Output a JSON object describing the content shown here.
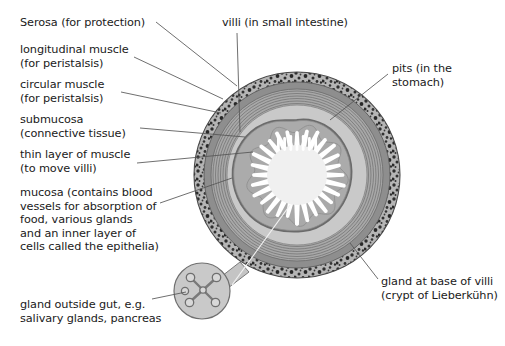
{
  "figure": {
    "background_color": "#ffffff",
    "text_color": "#1a1a1a",
    "leader_line_color": "#555555"
  },
  "palette": {
    "serosa_speckle_base": "#b9b9b9",
    "serosa_speckle_dot": "#2b2b2b",
    "longitudinal_muscle": "#8e8e8e",
    "circular_muscle": "#a6a6a6",
    "circular_muscle_stripe": "#7d7d7d",
    "submucosa": "#c9c9c9",
    "thin_muscle_layer": "#6f6f6f",
    "mucosa": "#a9a9a9",
    "villi": "#ffffff",
    "lumen": "#efefef",
    "gland_fill": "#c9c9c9",
    "gland_outline": "#6f6f6f"
  },
  "labels": {
    "serosa": {
      "lines": [
        "Serosa (for protection)"
      ],
      "x": 20,
      "y": 16
    },
    "longitudinal_muscle": {
      "lines": [
        "longitudinal muscle",
        "(for peristalsis)"
      ],
      "x": 20,
      "y": 43
    },
    "circular_muscle": {
      "lines": [
        "circular muscle",
        "(for peristalsis)"
      ],
      "x": 20,
      "y": 78
    },
    "submucosa": {
      "lines": [
        "submucosa",
        "(connective tissue)"
      ],
      "x": 20,
      "y": 113
    },
    "thin_layer_of_muscle": {
      "lines": [
        "thin layer of muscle",
        "(to move villi)"
      ],
      "x": 20,
      "y": 148
    },
    "mucosa": {
      "lines": [
        "mucosa (contains blood",
        "vessels for absorption of",
        "food, various glands",
        "and an inner layer of",
        "cells called the epithelia)"
      ],
      "x": 20,
      "y": 186
    },
    "gland_outside_gut": {
      "lines": [
        "gland outside gut, e.g.",
        "salivary glands, pancreas"
      ],
      "x": 20,
      "y": 298
    },
    "villi": {
      "lines": [
        "villi (in small intestine)"
      ],
      "x": 222,
      "y": 16
    },
    "pits": {
      "lines": [
        "pits (in the",
        "stomach)"
      ],
      "x": 392,
      "y": 62
    },
    "gland_at_base_of_villi": {
      "lines": [
        "gland at base of villi",
        "(crypt of Lieberkühn)"
      ],
      "x": 381,
      "y": 275
    }
  },
  "structure": {
    "center_x": 297,
    "center_y": 175,
    "outer_radius": 103,
    "layers": [
      {
        "name": "serosa",
        "outer_r": 103,
        "inner_r": 93
      },
      {
        "name": "longitudinal-muscle",
        "outer_r": 93,
        "inner_r": 86
      },
      {
        "name": "circular-muscle",
        "outer_r": 86,
        "inner_r": 71
      },
      {
        "name": "submucosa",
        "outer_r": 71,
        "inner_r": 52
      },
      {
        "name": "thin-layer-of-muscle",
        "outer_r": 52,
        "inner_r": 48
      },
      {
        "name": "mucosa",
        "outer_r": 48,
        "inner_r": 20
      }
    ],
    "villi_count": 28,
    "lumen_radius": 30,
    "circular_muscle_stripe_count": 7,
    "external_gland": {
      "center_x": 202,
      "center_y": 291,
      "radius": 28
    }
  }
}
